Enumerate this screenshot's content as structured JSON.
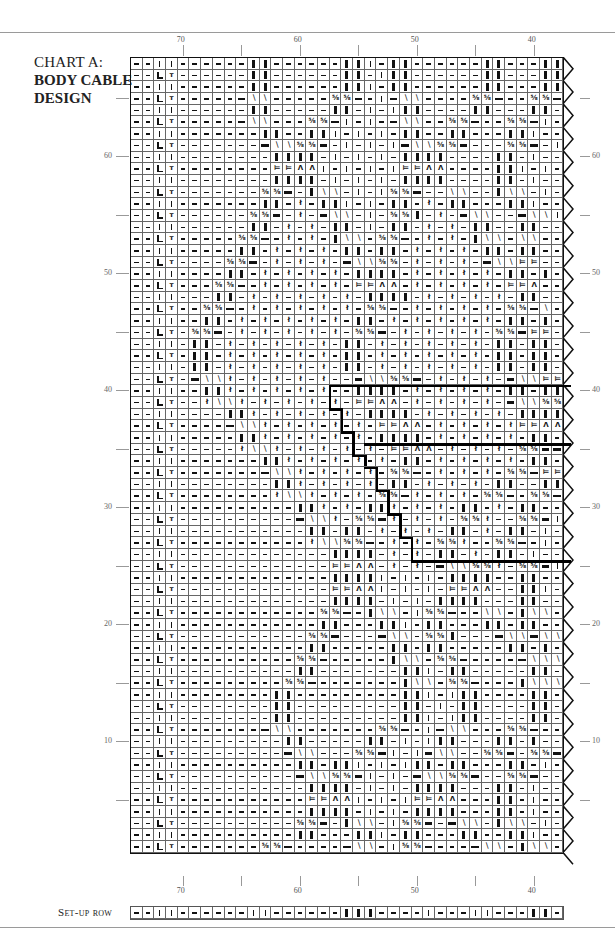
{
  "chart": {
    "title_line1": "CHART A:",
    "title_line2": "BODY CABLE",
    "title_line3": "DESIGN",
    "setup_label": "Set-up row",
    "top_column_labels": [
      {
        "col": 70,
        "text": "70"
      },
      {
        "col": 60,
        "text": "60"
      },
      {
        "col": 50,
        "text": "50"
      },
      {
        "col": 40,
        "text": "40"
      }
    ],
    "bottom_column_labels": [
      {
        "col": 70,
        "text": "70"
      },
      {
        "col": 60,
        "text": "60"
      },
      {
        "col": 50,
        "text": "50"
      },
      {
        "col": 40,
        "text": "40"
      }
    ],
    "left_row_labels": [
      {
        "row": 60,
        "text": "60"
      },
      {
        "row": 50,
        "text": "50"
      },
      {
        "row": 40,
        "text": "40"
      },
      {
        "row": 30,
        "text": "30"
      },
      {
        "row": 20,
        "text": "20"
      },
      {
        "row": 10,
        "text": "10"
      }
    ],
    "right_row_labels": [
      {
        "row": 60,
        "text": "60"
      },
      {
        "row": 50,
        "text": "50"
      },
      {
        "row": 40,
        "text": "40"
      },
      {
        "row": 30,
        "text": "30"
      },
      {
        "row": 20,
        "text": "20"
      },
      {
        "row": 10,
        "text": "10"
      }
    ],
    "columns": {
      "first": 74,
      "last": 38,
      "count": 37
    },
    "rows": {
      "first": 1,
      "last": 68,
      "count": 68
    },
    "legend_codes": {
      "-": "purl",
      "|": "knit",
      "I": "knit (bold)",
      "B": "purl (bold)",
      "L": "L symbol",
      "T": "t symbol",
      "R": "right cross 5/6",
      "X": "left cross",
      "x": "twisted stitch",
      "=": "15/14 symbol",
      "^": "decrease"
    },
    "setup_row": "--||------||------III----|---||---II",
    "grid_rows_top_to_bottom": [
      "--||------II------II|-II------II---II",
      "--LT------II------II-|II------II---II",
      "--||------II------II|-II------II---II",
      "--LT-----BXX-----RRB-|BXX----RRB--RRB",
      "--||------II-----II-|-|II----II---II-",
      "--LT-----BXX---RRB|-|-BXX--RRB--RRB|",
      "--||-------II--II|-|-|-II--II---II|-",
      "--LT-------BXXRRB-|-|-|BXXRRB---RRB-|",
      "--||--------IIII-|-|-|-IIII----II-|-",
      "--LT--------==^^|-|-|-|==^^----II|-|",
      "--||--------IIII-|-|-|-IIII----II-|-",
      "--LT-------RRB-IXX-|-|RRB--XX--IXX-|",
      "--||-------II-x-II|-|-II-x-II---II|-",
      "--LT------RRB-x-BXX-|-RRI-x-BXX--BXX|",
      "--||------II-x-x-II-|-II-x-x-II--II-",
      "--LT-----RRB-x-x-IXX-RRB-x-x-IXX-XX-",
      "--||-----II-x-x-x-II-II-x-x-x-II-II-",
      "--LT----RRB-x-x-x-BXXRR-x-x-x-BXX==-",
      "--||----II-x-x-x-x-IIII-x-x-x-x-II-I",
      "--LT---RRB-x-x-x-x-==^^-x-x-x-x-==^-",
      "--||---II-x-x-x-x-x-IIII-x-x-x-x-II-",
      "--LT--RRB-x-x-x-x-x-RRB-x-x-x-x-RRBX",
      "--||--II-x-x-x-x-x-II-x-x-x-x-x-II-I",
      "--LT-RRB-x-x-x-x-x-RRB-x-x-x-x-RRB==",
      "--||-II-x-x-x-x-x-II-x-x-x-x-x-II-II",
      "--LT-II-x-x-x-x-x-II-x-x-x-x-x-II-II",
      "--||-II-x-x-x-x-x-II-x-x-x-x-x-II-II",
      "--LT-BXXx-x-x-x-x--BXXRRB-x-x-x-BXX==",
      "--||--IIx-x-x-x-x--IIII-x-x-x-x-II-II",
      "--LT--xXXx-x-x-x-x-==^^-x-x-x-x-BXXRR",
      "--||----IIx-x-x-x-x-IIII-x-x-x-x-IIII",
      "--LT----BXXx-x-x-x-x-==^^-x-x-x-x==^^",
      "--||-----IIx-x-x-x-x-IIII-x-x-x-x-II-",
      "--LT-----xXXx-x-x-x-x-==^^-x-x-x-RRBB",
      "--||-------IIx-x-x-x-x-II-x-x-x-x-II-",
      "--LT-------BXXx-x-x-x-RRB-x-x-x-RRB==",
      "--||--------IIx-x-x-x-II-x-x-x-II--II",
      "--LT--------xXXx-x-x-RRBx-x-x-RRB-RRB",
      "--||----------IIx-x-IIx-x-x-II-x-II-",
      "--LT----------BXXx-RRBx-x-x-RRx--RRB|",
      "--||-----------II-II-x-x-x-II-x-II-|",
      "--LT-----------xXXRRB-x-x-RRx--RRB-|",
      "--||-------------IIII-x-x-II-x-II-|-",
      "--LT-------------==^^-x-x-BXXRRx-RRB|",
      "--||-------------IIII|-|-|-IIII--II-",
      "--LT-------------==^^|-|-|-==^^--II|",
      "--||-------------IIII-|-|-IIII---II-",
      "--LT------------RRB-IXX-|RRB--XX-IXX",
      "--||------------II---II|-II---II-II-",
      "--LT-----------RRB---BXX-RRI---BXXBXX",
      "--||-----------II-----II-II-----II-I-",
      "--LT----------RRB-----IXX-RRB----BXXX",
      "--||----------II-------II|-II-----II-",
      "--LT---------RRB-------IXX-RRB---IXXX",
      "--||--------II---------II|-|II----II-",
      "--LT--------II---------II-|-II----II-",
      "--||--------II---------II|-|II----II-",
      "--LT-------BXX-------RRB-|BXX---RRB-",
      "--||---------II-----II-|-|II---II-I-",
      "--LT---------BXX---RRB|-|BXX--RRB-RRB",
      "--||----------II-II|-|-|II-II---II-|",
      "--LT----------BXXRRB|-|-BXXRRB--RRB-",
      "--||-----------IIII-|-|-IIII---II-|-",
      "--LT-----------==^^|-|-|==^^---II-|-",
      "--||-----------IIII-|-|-IIII---II-|-",
      "--LT----------RRB-IXX-|RRB-BXX-IXX-|",
      "--||----------II---II|-II---II--II|-",
      "--LT-------RRB----BXX-|RRB---BXX-IXX"
    ]
  }
}
